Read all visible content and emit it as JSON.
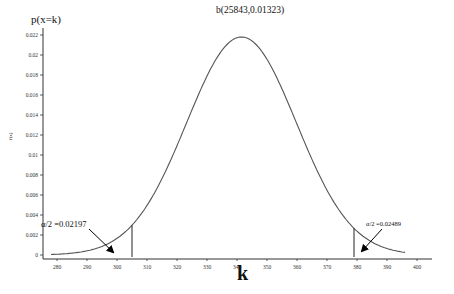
{
  "chart_data": {
    "type": "line",
    "title": "b(25843,0.01323)",
    "xlabel": "k",
    "ylabel": "p(x=k)",
    "ylabel_side": "f(x)",
    "xlim": [
      275,
      405
    ],
    "ylim": [
      0,
      0.023
    ],
    "x_ticks": [
      280,
      290,
      300,
      310,
      320,
      330,
      340,
      350,
      360,
      370,
      380,
      390,
      400
    ],
    "y_ticks": [
      0,
      0.002,
      0.004,
      0.006,
      0.008,
      0.01,
      0.012,
      0.014,
      0.016,
      0.018,
      0.02,
      0.022
    ],
    "y_tick_labels": [
      "0",
      "0.002",
      "0.004",
      "0.006",
      "0.008",
      "0.01",
      "0.012",
      "0.014",
      "0.016",
      "0.018",
      "0.02",
      "0.022"
    ],
    "grid": false,
    "series": [
      {
        "name": "b(25843,0.01323)",
        "distribution": "binomial",
        "n": 25843,
        "p": 0.01323,
        "mean": 341.9,
        "x_range": [
          278,
          396
        ],
        "x": [
          278,
          285,
          290,
          295,
          300,
          305,
          310,
          315,
          320,
          325,
          330,
          335,
          340,
          342,
          345,
          350,
          355,
          360,
          365,
          370,
          375,
          379,
          385,
          390,
          396
        ],
        "values": [
          0.0002,
          0.0005,
          0.0009,
          0.0015,
          0.0024,
          0.0036,
          0.0052,
          0.0071,
          0.01,
          0.013,
          0.0165,
          0.0196,
          0.0216,
          0.0218,
          0.0213,
          0.019,
          0.0155,
          0.0118,
          0.0085,
          0.0056,
          0.0037,
          0.003,
          0.0015,
          0.0009,
          0.0004
        ]
      }
    ],
    "critical_lines": [
      {
        "k": 305,
        "height": 0.003
      },
      {
        "k": 379,
        "height": 0.003
      }
    ],
    "annotations": [
      {
        "text": "α/2 =0.02197",
        "side": "left",
        "arrow_to_k": 300
      },
      {
        "text": "α/2 =0.02489",
        "side": "right",
        "arrow_to_k": 380
      }
    ]
  },
  "labels": {
    "title": "b(25843,0.01323)",
    "ylabel_top": "p(x=k)",
    "ylabel_side": "f(x)",
    "xlabel": "k",
    "ann_left": "α/2 =0.02197",
    "ann_right": "α/2 =0.02489"
  }
}
